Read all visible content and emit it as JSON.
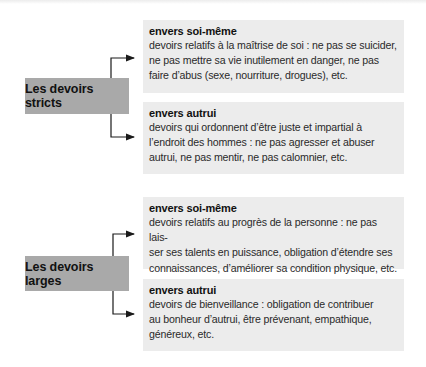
{
  "groups": [
    {
      "label": "Les devoirs stricts",
      "items": [
        {
          "title": "envers soi-même",
          "lines": [
            "devoirs relatifs à la maîtrise de soi : ne pas se suicider,",
            "ne pas mettre sa vie inutilement en danger, ne pas",
            "faire d’abus (sexe, nourriture, drogues), etc."
          ]
        },
        {
          "title": "envers autrui",
          "lines": [
            "devoirs qui ordonnent d’être juste et impartial à",
            "l’endroit des hommes : ne pas agresser et abuser",
            "autrui, ne pas mentir, ne pas calomnier, etc."
          ]
        }
      ]
    },
    {
      "label": "Les devoirs larges",
      "items": [
        {
          "title": "envers soi-même",
          "lines": [
            "devoirs relatifs au progrès de la personne : ne pas lais-",
            "ser ses talents en puissance, obligation d’étendre ses",
            "connaissances, d’améliorer sa condition physique, etc."
          ]
        },
        {
          "title": "envers autrui",
          "lines": [
            "devoirs de bienveillance : obligation de contribuer",
            "au bonheur d’autrui, être prévenant, empathique,",
            "généreux, etc."
          ]
        }
      ]
    }
  ]
}
